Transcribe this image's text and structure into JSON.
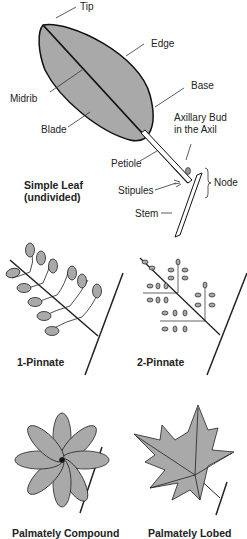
{
  "simple_leaf": {
    "labels": {
      "tip": "Tip",
      "edge": "Edge",
      "base": "Base",
      "midrib": "Midrib",
      "blade": "Blade",
      "axillary_bud_1": "Axillary Bud",
      "axillary_bud_2": "in the Axil",
      "petiole": "Petiole",
      "node": "Node",
      "stipules": "Stipules",
      "stem": "Stem"
    },
    "caption_1": "Simple Leaf",
    "caption_2": "(undivided)"
  },
  "compound": {
    "one_pinnate": "1-Pinnate",
    "two_pinnate": "2-Pinnate",
    "palmately_compound": "Palmately Compound",
    "palmately_lobed": "Palmately Lobed"
  },
  "colors": {
    "leaf_fill": "#a9a9a9",
    "outline": "#1a1a1a"
  }
}
